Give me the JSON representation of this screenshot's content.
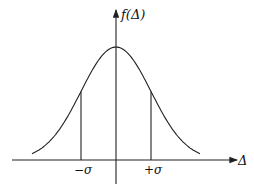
{
  "diagram": {
    "type": "normal-distribution-curve",
    "y_axis_label": "f(Δ)",
    "x_axis_label": "Δ",
    "markers": [
      {
        "id": "minus-sigma",
        "label": "−σ",
        "value": -1
      },
      {
        "id": "plus-sigma",
        "label": "+σ",
        "value": 1
      }
    ],
    "curve": {
      "mean": 0,
      "sigma": 1,
      "x_range": [
        -2.4,
        2.4
      ]
    }
  }
}
